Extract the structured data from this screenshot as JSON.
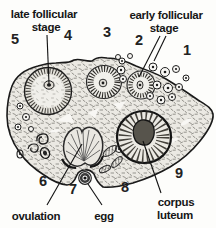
{
  "palette": {
    "ink": "#1a1a1a",
    "paper": "#fdfdfb",
    "stroma": "#ebe9e3"
  },
  "labels": {
    "late_follicular": {
      "line1": "late follicular",
      "line2": "stage"
    },
    "early_follicular": {
      "line1": "early follicular",
      "line2": "stage"
    },
    "ovulation": "ovulation",
    "egg": "egg",
    "corpus_luteum": {
      "line1": "corpus",
      "line2": "luteum"
    }
  },
  "numbers": {
    "n1": "1",
    "n2": "2",
    "n3": "3",
    "n4": "4",
    "n5": "5",
    "n6": "6",
    "n7": "7",
    "n8": "8",
    "n9": "9"
  }
}
